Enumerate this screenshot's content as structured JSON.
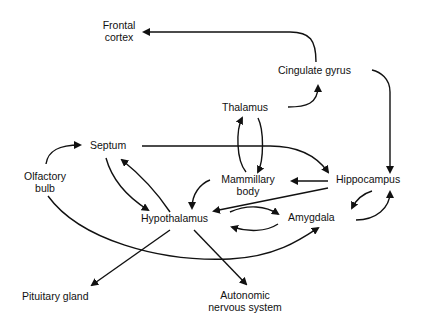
{
  "diagram": {
    "type": "flow",
    "colors": {
      "line": "#111111",
      "text": "#111111",
      "background": "#ffffff"
    },
    "nodes": {
      "frontal_cortex": {
        "line1": "Frontal",
        "line2": "cortex"
      },
      "cingulate_gyrus": {
        "label": "Cingulate gyrus"
      },
      "thalamus": {
        "label": "Thalamus"
      },
      "septum": {
        "label": "Septum"
      },
      "olfactory_bulb": {
        "line1": "Olfactory",
        "line2": "bulb"
      },
      "mammillary_body": {
        "line1": "Mammillary",
        "line2": "body"
      },
      "hippocampus": {
        "label": "Hippocampus"
      },
      "hypothalamus": {
        "label": "Hypothalamus"
      },
      "amygdala": {
        "label": "Amygdala"
      },
      "pituitary_gland": {
        "label": "Pituitary gland"
      },
      "autonomic_nervous_system": {
        "line1": "Autonomic",
        "line2": "nervous system"
      }
    },
    "edges": [
      {
        "from": "Cingulate gyrus",
        "to": "Frontal cortex"
      },
      {
        "from": "Cingulate gyrus",
        "to": "Hippocampus"
      },
      {
        "from": "Thalamus",
        "to": "Cingulate gyrus"
      },
      {
        "from": "Mammillary body",
        "to": "Thalamus"
      },
      {
        "from": "Thalamus",
        "to": "Mammillary body"
      },
      {
        "from": "Septum",
        "to": "Hippocampus"
      },
      {
        "from": "Olfactory bulb",
        "to": "Septum"
      },
      {
        "from": "Olfactory bulb",
        "to": "Amygdala"
      },
      {
        "from": "Septum",
        "to": "Hypothalamus"
      },
      {
        "from": "Hypothalamus",
        "to": "Septum"
      },
      {
        "from": "Hippocampus",
        "to": "Mammillary body"
      },
      {
        "from": "Hippocampus",
        "to": "Hypothalamus"
      },
      {
        "from": "Mammillary body",
        "to": "Hypothalamus"
      },
      {
        "from": "Hypothalamus",
        "to": "Amygdala"
      },
      {
        "from": "Amygdala",
        "to": "Hypothalamus"
      },
      {
        "from": "Hippocampus",
        "to": "Amygdala"
      },
      {
        "from": "Amygdala",
        "to": "Hippocampus"
      },
      {
        "from": "Hypothalamus",
        "to": "Pituitary gland"
      },
      {
        "from": "Hypothalamus",
        "to": "Autonomic nervous system"
      }
    ]
  }
}
